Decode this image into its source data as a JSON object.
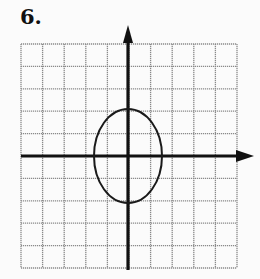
{
  "problem": {
    "number": "6."
  },
  "graph": {
    "grid": {
      "cols": 10,
      "rows": 10,
      "left": 21,
      "top": 44,
      "right": 237,
      "bottom": 268,
      "color": "#8a8a8a"
    },
    "axes": {
      "origin_x": 128,
      "origin_y": 156,
      "color": "#111111"
    },
    "ellipse": {
      "cx": 128,
      "cy": 156,
      "rx": 34,
      "ry": 47,
      "color": "#1a1a1a"
    }
  }
}
